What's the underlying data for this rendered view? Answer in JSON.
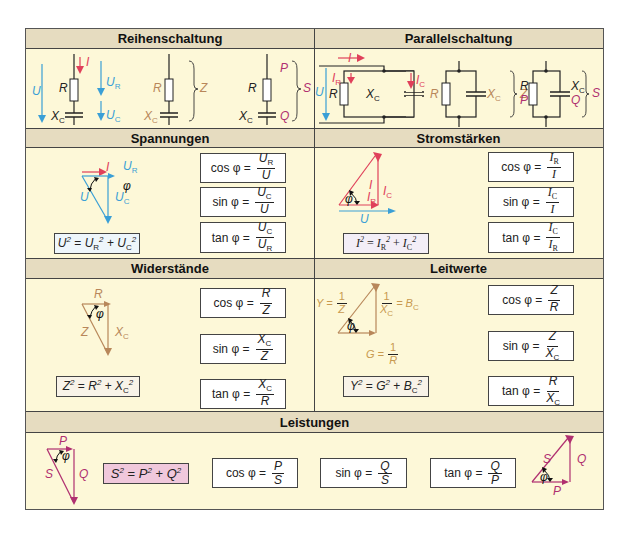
{
  "colors": {
    "header_bg": "#e6dcc0",
    "cell_bg": "#fdf8d8",
    "voltage_blue": "#3a9fd6",
    "current_red": "#e0405a",
    "resistance_brown": "#b8875a",
    "admittance_orange": "#c89a50",
    "power_magenta": "#b03070",
    "power_box_pink": "#f0c8dc"
  },
  "sections": {
    "series": {
      "title": "Reihenschaltung",
      "labels": {
        "I": "I",
        "U": "U",
        "R": "R",
        "XC": "X",
        "XC_sub": "C",
        "UR": "U",
        "UR_sub": "R",
        "UC": "U",
        "UC_sub": "C",
        "Z": "Z",
        "P": "P",
        "Q": "Q",
        "S": "S"
      }
    },
    "parallel": {
      "title": "Parallelschaltung",
      "labels": {
        "I": "I",
        "IR": "I",
        "IR_sub": "R",
        "IC": "I",
        "IC_sub": "C",
        "U": "U",
        "R": "R",
        "XC": "X",
        "XC_sub": "C",
        "Z": "Z",
        "P": "P",
        "Q": "Q",
        "S": "S"
      }
    },
    "voltages": {
      "title": "Spannungen",
      "triangle_labels": {
        "I": "I",
        "UR": "U",
        "UR_sub": "R",
        "U": "U",
        "UC": "U",
        "UC_sub": "C",
        "phi": "φ"
      },
      "pythagoras": {
        "lhs": "U",
        "rhs1": "U",
        "rhs1_sub": "R",
        "rhs2": "U",
        "rhs2_sub": "C"
      },
      "formulas": [
        {
          "fn": "cos φ =",
          "num": "U",
          "num_sub": "R",
          "den": "U",
          "den_sub": ""
        },
        {
          "fn": "sin φ =",
          "num": "U",
          "num_sub": "C",
          "den": "U",
          "den_sub": ""
        },
        {
          "fn": "tan φ =",
          "num": "U",
          "num_sub": "C",
          "den": "U",
          "den_sub": "R"
        }
      ]
    },
    "currents": {
      "title": "Stromstärken",
      "triangle_labels": {
        "I": "I",
        "IR": "I",
        "IR_sub": "R",
        "IC": "I",
        "IC_sub": "C",
        "U": "U",
        "phi": "φ"
      },
      "pythagoras": {
        "lhs": "I",
        "rhs1": "I",
        "rhs1_sub": "R",
        "rhs2": "I",
        "rhs2_sub": "C"
      },
      "formulas": [
        {
          "fn": "cos φ =",
          "num": "I",
          "num_sub": "R",
          "den": "I",
          "den_sub": ""
        },
        {
          "fn": "sin φ =",
          "num": "I",
          "num_sub": "C",
          "den": "I",
          "den_sub": ""
        },
        {
          "fn": "tan φ =",
          "num": "I",
          "num_sub": "C",
          "den": "I",
          "den_sub": "R"
        }
      ]
    },
    "resistances": {
      "title": "Widerstände",
      "triangle_labels": {
        "R": "R",
        "Z": "Z",
        "XC": "X",
        "XC_sub": "C",
        "phi": "φ"
      },
      "pythagoras": {
        "lhs": "Z",
        "rhs1": "R",
        "rhs1_sub": "",
        "rhs2": "X",
        "rhs2_sub": "C"
      },
      "formulas": [
        {
          "fn": "cos φ =",
          "num": "R",
          "num_sub": "",
          "den": "Z",
          "den_sub": ""
        },
        {
          "fn": "sin φ =",
          "num": "X",
          "num_sub": "C",
          "den": "Z",
          "den_sub": ""
        },
        {
          "fn": "tan φ =",
          "num": "X",
          "num_sub": "C",
          "den": "R",
          "den_sub": ""
        }
      ]
    },
    "conductances": {
      "title": "Leitwerte",
      "triangle_labels": {
        "Y": "Y =",
        "Y_num": "1",
        "Y_den": "Z",
        "BC_num": "1",
        "BC_den": "X",
        "BC_den_sub": "C",
        "BC_eq": "= B",
        "BC_sub": "C",
        "G": "G =",
        "G_num": "1",
        "G_den": "R",
        "phi": "φ"
      },
      "pythagoras": {
        "lhs": "Y",
        "rhs1": "G",
        "rhs1_sub": "",
        "rhs2": "B",
        "rhs2_sub": "C"
      },
      "formulas": [
        {
          "fn": "cos φ =",
          "num": "Z",
          "num_sub": "",
          "den": "R",
          "den_sub": ""
        },
        {
          "fn": "sin φ =",
          "num": "Z",
          "num_sub": "",
          "den": "X",
          "den_sub": "C"
        },
        {
          "fn": "tan φ =",
          "num": "R",
          "num_sub": "",
          "den": "X",
          "den_sub": "C"
        }
      ]
    },
    "power": {
      "title": "Leistungen",
      "triangle_left_labels": {
        "P": "P",
        "S": "S",
        "Q": "Q",
        "phi": "φ"
      },
      "triangle_right_labels": {
        "P": "P",
        "S": "S",
        "Q": "Q",
        "phi": "φ"
      },
      "pythagoras": {
        "lhs": "S",
        "rhs1": "P",
        "rhs1_sub": "",
        "rhs2": "Q",
        "rhs2_sub": ""
      },
      "formulas": [
        {
          "fn": "cos φ =",
          "num": "P",
          "num_sub": "",
          "den": "S",
          "den_sub": ""
        },
        {
          "fn": "sin φ =",
          "num": "Q",
          "num_sub": "",
          "den": "S",
          "den_sub": ""
        },
        {
          "fn": "tan φ =",
          "num": "Q",
          "num_sub": "",
          "den": "P",
          "den_sub": ""
        }
      ]
    }
  },
  "common": {
    "sq": "2",
    "eq": "=",
    "plus": "+"
  }
}
